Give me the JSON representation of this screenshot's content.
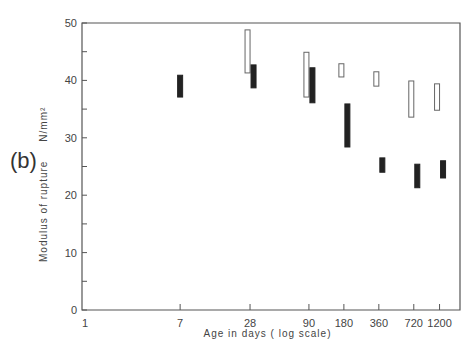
{
  "panel_label": "(b)",
  "chart_data": {
    "type": "range-bar",
    "title": "",
    "xlabel": "Age in days ( log scale)",
    "ylabel": "Modulus of rupture N/mm²",
    "x_scale": "log",
    "x_ticks": [
      1,
      7,
      28,
      90,
      180,
      360,
      720,
      1200
    ],
    "y_ticks": [
      0,
      10,
      20,
      30,
      40,
      50
    ],
    "ylim": [
      0,
      50
    ],
    "grid": false,
    "series": [
      {
        "name": "open",
        "style": "hollow",
        "ranges": [
          {
            "x": 28,
            "low": 41.3,
            "high": 48.8
          },
          {
            "x": 90,
            "low": 37.1,
            "high": 44.9
          },
          {
            "x": 180,
            "low": 40.6,
            "high": 42.9
          },
          {
            "x": 360,
            "low": 39.0,
            "high": 41.5
          },
          {
            "x": 720,
            "low": 33.6,
            "high": 39.9
          },
          {
            "x": 1200,
            "low": 34.8,
            "high": 39.4
          }
        ]
      },
      {
        "name": "filled",
        "style": "solid",
        "ranges": [
          {
            "x": 7,
            "low": 37.1,
            "high": 40.9
          },
          {
            "x": 28,
            "low": 38.7,
            "high": 42.7
          },
          {
            "x": 90,
            "low": 36.1,
            "high": 42.2
          },
          {
            "x": 180,
            "low": 28.4,
            "high": 35.9
          },
          {
            "x": 360,
            "low": 24.0,
            "high": 26.5
          },
          {
            "x": 720,
            "low": 21.3,
            "high": 25.4
          },
          {
            "x": 1200,
            "low": 23.0,
            "high": 26.0
          }
        ]
      }
    ]
  },
  "axis": {
    "xlabel": "Age in days ( log scale)",
    "ylabel": "Modulus of rupture",
    "yunit": "N/mm²"
  }
}
